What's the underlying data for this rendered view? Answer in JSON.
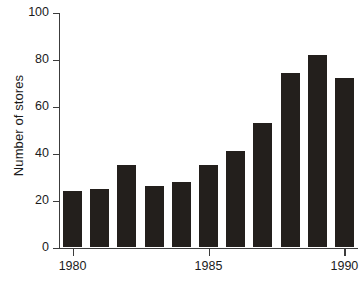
{
  "chart_data": {
    "type": "bar",
    "title": "",
    "subtitle": "",
    "xlabel": "",
    "ylabel": "Number of stores",
    "categories": [
      1980,
      1981,
      1982,
      1983,
      1984,
      1985,
      1986,
      1987,
      1988,
      1989,
      1990
    ],
    "values": [
      24,
      25,
      35,
      26,
      28,
      35,
      41,
      53,
      74,
      82,
      72
    ],
    "series": [
      {
        "name": "Number of stores",
        "values": [
          24,
          25,
          35,
          26,
          28,
          35,
          41,
          53,
          74,
          82,
          72
        ]
      }
    ],
    "ylim": [
      0,
      100
    ],
    "xlim": [
      1979.5,
      1990.5
    ],
    "y_ticks": [
      0,
      20,
      40,
      60,
      80,
      100
    ],
    "y_tick_labels": [
      "0",
      "20",
      "40",
      "60",
      "80",
      "100"
    ],
    "x_ticks": [
      1980,
      1985,
      1990
    ],
    "x_tick_labels": [
      "1980",
      "1985",
      "1990"
    ],
    "grid": false,
    "legend": false,
    "legend_position": "none",
    "bar_color": "#231f1c",
    "axis_color": "#3c3c3c",
    "background_color": "#ffffff",
    "annotations": []
  }
}
